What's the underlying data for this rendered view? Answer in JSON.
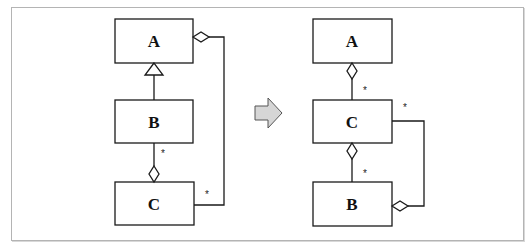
{
  "diagram": {
    "type": "UML class diagram refactoring",
    "transform_arrow": "right-arrow",
    "before": {
      "classes": [
        {
          "id": "A",
          "label": "A"
        },
        {
          "id": "B",
          "label": "B"
        },
        {
          "id": "C",
          "label": "C"
        }
      ],
      "relations": [
        {
          "kind": "generalization",
          "from": "B",
          "to": "A"
        },
        {
          "kind": "aggregation",
          "whole": "C",
          "part": "B",
          "multiplicity": "*"
        },
        {
          "kind": "aggregation",
          "whole": "A",
          "part": "C",
          "multiplicity": "*"
        }
      ]
    },
    "after": {
      "classes": [
        {
          "id": "A",
          "label": "A"
        },
        {
          "id": "C",
          "label": "C"
        },
        {
          "id": "B",
          "label": "B"
        }
      ],
      "relations": [
        {
          "kind": "aggregation",
          "whole": "A",
          "part": "C",
          "multiplicity": "*"
        },
        {
          "kind": "aggregation",
          "whole": "C",
          "part": "B",
          "multiplicity": "*"
        },
        {
          "kind": "aggregation",
          "whole": "B",
          "part": "C",
          "multiplicity": "*"
        }
      ]
    }
  },
  "labels": {
    "left_A": "A",
    "left_B": "B",
    "left_C": "C",
    "right_A": "A",
    "right_C": "C",
    "right_B": "B",
    "star": "*"
  },
  "colors": {
    "line": "#1a1a1a",
    "frame": "#b4b4b4",
    "arrow_fill": "#d6d6d6",
    "arrow_stroke": "#555555"
  }
}
